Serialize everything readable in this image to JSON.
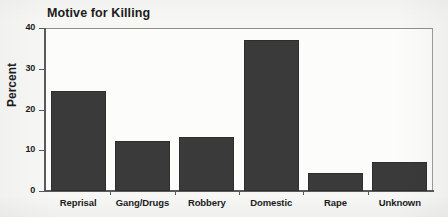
{
  "chart_data": {
    "type": "bar",
    "title": "Motive for Killing",
    "xlabel": "",
    "ylabel": "Percent",
    "categories": [
      "Reprisal",
      "Gang/Drugs",
      "Robbery",
      "Domestic",
      "Rape",
      "Unknown"
    ],
    "values": [
      24.5,
      12.2,
      13.2,
      37,
      4.5,
      7
    ],
    "ylim": [
      0,
      40
    ],
    "yticks": [
      0,
      10,
      20,
      30,
      40
    ],
    "ytick_labels": [
      "0",
      "10",
      "20",
      "30",
      "40"
    ],
    "grid": false,
    "legend": null,
    "bar_color": "#3a3a3a",
    "axis_color": "#5a5a5a",
    "plot_background": "#fcfcfa"
  }
}
